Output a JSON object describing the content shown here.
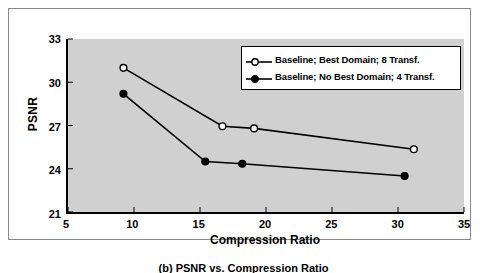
{
  "caption": "(b) PSNR vs. Compression Ratio",
  "colors": {
    "plot_background": "#d0d0d0",
    "axis": "#000000",
    "series_line": "#000000",
    "figure_background": "#ffffff",
    "frame_border": "#8a8a8a"
  },
  "legend": {
    "position": "top-right",
    "entries": [
      {
        "label": "Baseline; Best Domain; 8 Transf.",
        "marker": "open-circle-marker"
      },
      {
        "label": "Baseline; No Best Domain; 4 Transf.",
        "marker": "filled-circle-marker"
      }
    ]
  },
  "chart_data": {
    "type": "line",
    "title": "(b) PSNR vs. Compression Ratio",
    "xlabel": "Compression Ratio",
    "ylabel": "PSNR",
    "xlim": [
      5,
      35
    ],
    "ylim": [
      21,
      33
    ],
    "xticks": [
      5,
      10,
      15,
      20,
      25,
      30,
      35
    ],
    "yticks": [
      21,
      24,
      27,
      30,
      33
    ],
    "grid": false,
    "legend_position": "top-right",
    "series": [
      {
        "name": "Baseline; Best Domain; 8 Transf.",
        "marker": "open-circle",
        "x": [
          9.2,
          16.7,
          19.1,
          31.2
        ],
        "y": [
          31.0,
          26.95,
          26.8,
          25.35
        ]
      },
      {
        "name": "Baseline; No Best Domain; 4 Transf.",
        "marker": "filled-circle",
        "x": [
          9.2,
          15.4,
          18.2,
          30.5
        ],
        "y": [
          29.2,
          24.5,
          24.35,
          23.5
        ]
      }
    ]
  }
}
